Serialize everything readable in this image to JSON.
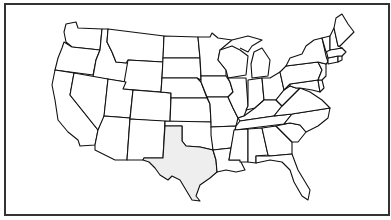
{
  "map": {
    "title": "United States outline map",
    "highlighted_state": "Texas",
    "colors": {
      "background": "#ffffff",
      "state_fill": "#ffffff",
      "highlight_fill": "#eeeeee",
      "border": "#111111",
      "frame": "#333333"
    },
    "states": [
      "Washington",
      "Oregon",
      "California",
      "Idaho",
      "Nevada",
      "Montana",
      "Wyoming",
      "Utah",
      "Arizona",
      "Colorado",
      "New Mexico",
      "North Dakota",
      "South Dakota",
      "Nebraska",
      "Kansas",
      "Oklahoma",
      "Texas",
      "Minnesota",
      "Iowa",
      "Missouri",
      "Arkansas",
      "Louisiana",
      "Wisconsin",
      "Illinois",
      "Michigan",
      "Indiana",
      "Ohio",
      "Kentucky",
      "Tennessee",
      "Mississippi",
      "Alabama",
      "Georgia",
      "Florida",
      "South Carolina",
      "North Carolina",
      "Virginia",
      "West Virginia",
      "Maryland",
      "Delaware",
      "Pennsylvania",
      "New Jersey",
      "New York",
      "Connecticut",
      "Rhode Island",
      "Massachusetts",
      "Vermont",
      "New Hampshire",
      "Maine"
    ]
  }
}
